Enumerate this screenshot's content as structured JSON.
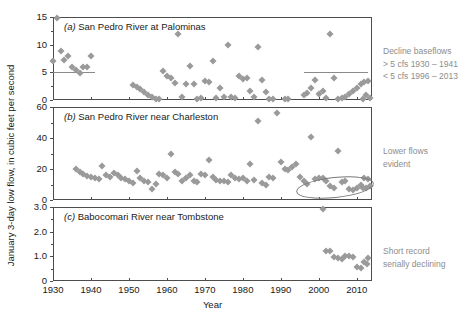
{
  "figure": {
    "ylabel": "January 3-day low flow, in cubic feet per second",
    "xlabel": "Year"
  },
  "chart_data": {
    "type": "scatter",
    "title": "",
    "xlabel": "Year",
    "ylabel": "January 3-day low flow, in cubic feet per second",
    "xlim": [
      1930,
      2014
    ],
    "xticks": [
      1930,
      1940,
      1950,
      1960,
      1970,
      1980,
      1990,
      2000,
      2010
    ],
    "grid": false,
    "legend": "none",
    "panels": [
      {
        "key": "a",
        "tag": "(a)",
        "title": "San Pedro River at Palominas",
        "ylim": [
          0,
          15
        ],
        "yticks": [
          0,
          5,
          10,
          15
        ],
        "ytick_labels": [
          "0",
          "5",
          "10",
          "15"
        ],
        "reference_lines": [
          {
            "y": 5,
            "x_start": 1930,
            "x_end": 1941
          },
          {
            "y": 5,
            "x_start": 1996,
            "x_end": 2013
          }
        ],
        "annotation": {
          "lines": [
            "Decline baseflows",
            "> 5 cfs 1930 – 1941",
            "< 5 cfs 1996 – 2013"
          ]
        },
        "points": [
          {
            "x": 1930,
            "y": 7.0
          },
          {
            "x": 1931,
            "y": 14.9
          },
          {
            "x": 1932,
            "y": 8.9
          },
          {
            "x": 1933,
            "y": 7.2
          },
          {
            "x": 1934,
            "y": 8.0
          },
          {
            "x": 1935,
            "y": 6.0
          },
          {
            "x": 1936,
            "y": 5.4
          },
          {
            "x": 1937,
            "y": 4.9
          },
          {
            "x": 1938,
            "y": 5.9
          },
          {
            "x": 1939,
            "y": 5.9
          },
          {
            "x": 1940,
            "y": 7.9
          },
          {
            "x": 1951,
            "y": 2.8
          },
          {
            "x": 1952,
            "y": 2.4
          },
          {
            "x": 1953,
            "y": 1.9
          },
          {
            "x": 1954,
            "y": 1.4
          },
          {
            "x": 1955,
            "y": 0.9
          },
          {
            "x": 1956,
            "y": 0.5
          },
          {
            "x": 1957,
            "y": 0.2
          },
          {
            "x": 1958,
            "y": 0.1
          },
          {
            "x": 1959,
            "y": 5.2
          },
          {
            "x": 1960,
            "y": 4.3
          },
          {
            "x": 1961,
            "y": 3.9
          },
          {
            "x": 1962,
            "y": 3.1
          },
          {
            "x": 1963,
            "y": 12.0
          },
          {
            "x": 1964,
            "y": 0.6
          },
          {
            "x": 1965,
            "y": 2.9
          },
          {
            "x": 1966,
            "y": 6.2
          },
          {
            "x": 1967,
            "y": 2.9
          },
          {
            "x": 1968,
            "y": 0.2
          },
          {
            "x": 1969,
            "y": 0.4
          },
          {
            "x": 1970,
            "y": 3.4
          },
          {
            "x": 1971,
            "y": 3.3
          },
          {
            "x": 1972,
            "y": 7.0
          },
          {
            "x": 1973,
            "y": 0.3
          },
          {
            "x": 1974,
            "y": 2.2
          },
          {
            "x": 1975,
            "y": 0.5
          },
          {
            "x": 1976,
            "y": 10.0
          },
          {
            "x": 1977,
            "y": 0.6
          },
          {
            "x": 1978,
            "y": 0.4
          },
          {
            "x": 1979,
            "y": 4.4
          },
          {
            "x": 1980,
            "y": 3.8
          },
          {
            "x": 1981,
            "y": 4.0
          },
          {
            "x": 1982,
            "y": 1.6
          },
          {
            "x": 1983,
            "y": 0.6
          },
          {
            "x": 1984,
            "y": 9.5
          },
          {
            "x": 1985,
            "y": 3.6
          },
          {
            "x": 1986,
            "y": 1.5
          },
          {
            "x": 1987,
            "y": 0.2
          },
          {
            "x": 1988,
            "y": 0.1
          },
          {
            "x": 1991,
            "y": 0.2
          },
          {
            "x": 1992,
            "y": 0.1
          },
          {
            "x": 1996,
            "y": 0.9
          },
          {
            "x": 1997,
            "y": 1.3
          },
          {
            "x": 1998,
            "y": 2.1
          },
          {
            "x": 1999,
            "y": 3.6
          },
          {
            "x": 2000,
            "y": 1.0
          },
          {
            "x": 2001,
            "y": 1.6
          },
          {
            "x": 2002,
            "y": 0.4
          },
          {
            "x": 2003,
            "y": 12.0
          },
          {
            "x": 2004,
            "y": 3.9
          },
          {
            "x": 2005,
            "y": 0.2
          },
          {
            "x": 2006,
            "y": 0.3
          },
          {
            "x": 2007,
            "y": 0.6
          },
          {
            "x": 2008,
            "y": 1.1
          },
          {
            "x": 2009,
            "y": 1.6
          },
          {
            "x": 2010,
            "y": 2.2
          },
          {
            "x": 2011,
            "y": 2.9
          },
          {
            "x": 2012,
            "y": 3.3
          },
          {
            "x": 2013,
            "y": 3.5
          },
          {
            "x": 2013.5,
            "y": 0.4
          },
          {
            "x": 2012.5,
            "y": 0.9
          },
          {
            "x": 2011.5,
            "y": 0.2
          }
        ]
      },
      {
        "key": "b",
        "tag": "(b)",
        "title": "San Pedro River near Charleston",
        "ylim": [
          0,
          60
        ],
        "yticks": [
          0,
          20,
          40,
          60
        ],
        "ytick_labels": [
          "0",
          "20",
          "40",
          "60"
        ],
        "reference_lines": [],
        "annotation": {
          "lines": [
            "Lower flows",
            "evident"
          ],
          "ellipse": {
            "x_center": 2004,
            "y_center": 9,
            "x_half_width": 10,
            "y_half_height": 6
          }
        },
        "points": [
          {
            "x": 1936,
            "y": 20.0
          },
          {
            "x": 1937,
            "y": 18.0
          },
          {
            "x": 1938,
            "y": 16.5
          },
          {
            "x": 1939,
            "y": 15.5
          },
          {
            "x": 1940,
            "y": 15.0
          },
          {
            "x": 1941,
            "y": 14.0
          },
          {
            "x": 1942,
            "y": 13.5
          },
          {
            "x": 1943,
            "y": 22.0
          },
          {
            "x": 1944,
            "y": 16.0
          },
          {
            "x": 1945,
            "y": 15.0
          },
          {
            "x": 1946,
            "y": 17.5
          },
          {
            "x": 1947,
            "y": 16.0
          },
          {
            "x": 1948,
            "y": 14.0
          },
          {
            "x": 1949,
            "y": 13.5
          },
          {
            "x": 1950,
            "y": 12.5
          },
          {
            "x": 1951,
            "y": 11.0
          },
          {
            "x": 1952,
            "y": 19.0
          },
          {
            "x": 1953,
            "y": 14.0
          },
          {
            "x": 1954,
            "y": 12.5
          },
          {
            "x": 1955,
            "y": 11.5
          },
          {
            "x": 1956,
            "y": 7.0
          },
          {
            "x": 1957,
            "y": 10.5
          },
          {
            "x": 1958,
            "y": 17.0
          },
          {
            "x": 1959,
            "y": 16.0
          },
          {
            "x": 1960,
            "y": 14.0
          },
          {
            "x": 1961,
            "y": 29.5
          },
          {
            "x": 1962,
            "y": 18.0
          },
          {
            "x": 1963,
            "y": 16.5
          },
          {
            "x": 1964,
            "y": 12.0
          },
          {
            "x": 1965,
            "y": 14.5
          },
          {
            "x": 1966,
            "y": 16.0
          },
          {
            "x": 1967,
            "y": 12.0
          },
          {
            "x": 1968,
            "y": 11.5
          },
          {
            "x": 1969,
            "y": 17.0
          },
          {
            "x": 1970,
            "y": 16.0
          },
          {
            "x": 1971,
            "y": 25.5
          },
          {
            "x": 1972,
            "y": 15.0
          },
          {
            "x": 1973,
            "y": 13.0
          },
          {
            "x": 1974,
            "y": 12.0
          },
          {
            "x": 1975,
            "y": 12.5
          },
          {
            "x": 1976,
            "y": 11.5
          },
          {
            "x": 1977,
            "y": 16.0
          },
          {
            "x": 1978,
            "y": 14.0
          },
          {
            "x": 1979,
            "y": 13.5
          },
          {
            "x": 1980,
            "y": 14.0
          },
          {
            "x": 1981,
            "y": 12.5
          },
          {
            "x": 1982,
            "y": 23.5
          },
          {
            "x": 1983,
            "y": 13.0
          },
          {
            "x": 1984,
            "y": 51.0
          },
          {
            "x": 1985,
            "y": 11.0
          },
          {
            "x": 1986,
            "y": 10.0
          },
          {
            "x": 1987,
            "y": 15.0
          },
          {
            "x": 1988,
            "y": 14.0
          },
          {
            "x": 1989,
            "y": 56.0
          },
          {
            "x": 1990,
            "y": 24.5
          },
          {
            "x": 1991,
            "y": 20.0
          },
          {
            "x": 1992,
            "y": 19.5
          },
          {
            "x": 1993,
            "y": 21.0
          },
          {
            "x": 1994,
            "y": 23.0
          },
          {
            "x": 1995,
            "y": 15.0
          },
          {
            "x": 1996,
            "y": 12.0
          },
          {
            "x": 1997,
            "y": 10.5
          },
          {
            "x": 1998,
            "y": 40.5
          },
          {
            "x": 1999,
            "y": 13.5
          },
          {
            "x": 2000,
            "y": 14.0
          },
          {
            "x": 2001,
            "y": 14.0
          },
          {
            "x": 2002,
            "y": 12.0
          },
          {
            "x": 2003,
            "y": 9.0
          },
          {
            "x": 2004,
            "y": 8.0
          },
          {
            "x": 2005,
            "y": 31.5
          },
          {
            "x": 2006,
            "y": 11.5
          },
          {
            "x": 2007,
            "y": 12.5
          },
          {
            "x": 2008,
            "y": 7.0
          },
          {
            "x": 2009,
            "y": 6.5
          },
          {
            "x": 2010,
            "y": 8.0
          },
          {
            "x": 2011,
            "y": 9.5
          },
          {
            "x": 2012,
            "y": 14.0
          },
          {
            "x": 2013,
            "y": 13.5
          },
          {
            "x": 2013.5,
            "y": 9.0
          },
          {
            "x": 2012.5,
            "y": 8.0
          },
          {
            "x": 2011.5,
            "y": 7.5
          }
        ]
      },
      {
        "key": "c",
        "tag": "(c)",
        "title": "Babocomari River near Tombstone",
        "ylim": [
          0,
          3.0
        ],
        "yticks": [
          0,
          1.0,
          2.0,
          3.0
        ],
        "ytick_labels": [
          "0",
          "1.0",
          "2.0",
          "3.0"
        ],
        "reference_lines": [],
        "annotation": {
          "lines": [
            "Short record",
            "serially declining"
          ]
        },
        "points": [
          {
            "x": 2001,
            "y": 2.93
          },
          {
            "x": 2002,
            "y": 1.22
          },
          {
            "x": 2003,
            "y": 1.2
          },
          {
            "x": 2004,
            "y": 0.97
          },
          {
            "x": 2005,
            "y": 0.93
          },
          {
            "x": 2006,
            "y": 0.88
          },
          {
            "x": 2007,
            "y": 1.02
          },
          {
            "x": 2008,
            "y": 1.0
          },
          {
            "x": 2009,
            "y": 0.98
          },
          {
            "x": 2010,
            "y": 0.55
          },
          {
            "x": 2011,
            "y": 0.52
          },
          {
            "x": 2012,
            "y": 0.78
          },
          {
            "x": 2012.6,
            "y": 0.7
          },
          {
            "x": 2013,
            "y": 0.95
          }
        ]
      }
    ]
  }
}
